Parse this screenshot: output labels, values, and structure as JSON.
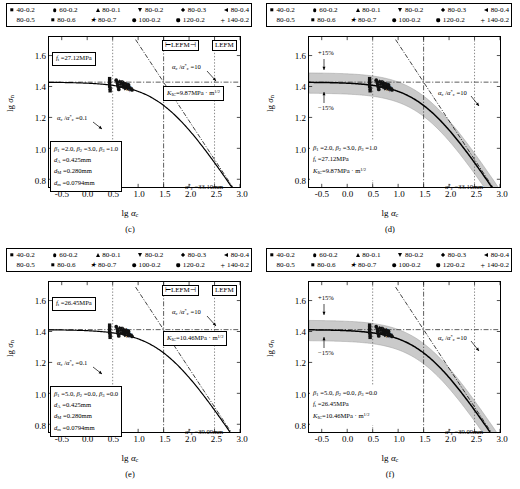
{
  "figure": {
    "panels": [
      "c",
      "d",
      "e",
      "f"
    ],
    "legend_entries": [
      {
        "label": "40-0.2",
        "marker": "square"
      },
      {
        "label": "60-0.2",
        "marker": "circle"
      },
      {
        "label": "80-0.1",
        "marker": "triangle-up"
      },
      {
        "label": "80-0.2",
        "marker": "triangle-down"
      },
      {
        "label": "80-0.3",
        "marker": "diamond"
      },
      {
        "label": "80-0.4",
        "marker": "triangle-left"
      },
      {
        "label": "80-0.5",
        "marker": "triangle-right"
      },
      {
        "label": "80-0.6",
        "marker": "square"
      },
      {
        "label": "80-0.7",
        "marker": "star"
      },
      {
        "label": "100-0.2",
        "marker": "circle"
      },
      {
        "label": "120-0.2",
        "marker": "hexagon"
      },
      {
        "label": "140-0.2",
        "marker": "plus"
      }
    ]
  },
  "chart_data": [
    {
      "id": "c",
      "type": "scatter",
      "panel_label": "(c)",
      "title": "",
      "xlabel": "lg αc",
      "ylabel": "lg σn",
      "xlim": [
        -0.75,
        3.0
      ],
      "ylim": [
        0.75,
        1.72
      ],
      "xticks": [
        "-0.5",
        "0.0",
        "0.5",
        "1.0",
        "1.5",
        "2.0",
        "2.5",
        "3.0"
      ],
      "xtick_values": [
        -0.5,
        0.0,
        0.5,
        1.0,
        1.5,
        2.0,
        2.5,
        3.0
      ],
      "yticks": [
        "0.8",
        "1.0",
        "1.2",
        "1.4",
        "1.6"
      ],
      "ytick_values": [
        0.8,
        1.0,
        1.2,
        1.4,
        1.6
      ],
      "grid": false,
      "band": false,
      "curve_plateau": 1.428,
      "annotations": {
        "ft": "ft =27.12MPa",
        "kic": "KIC=9.87MPa · m1/2",
        "ratio_low": "αc /α*c =0.1",
        "ratio_high": "αc /α*c =10",
        "alpha_star": "α*c =33.10mm",
        "lefm_left": "LEFM",
        "lefm_right": "LEFM",
        "params": [
          "β1 =2.0, β2 =3.0, β3 =1.0",
          "dA =0.425mm",
          "dM =0.280mm",
          "dm =0.0794mm"
        ]
      },
      "points": [
        {
          "x": 0.44,
          "y": 1.451,
          "m": "square"
        },
        {
          "x": 0.44,
          "y": 1.435,
          "m": "square"
        },
        {
          "x": 0.44,
          "y": 1.418,
          "m": "square"
        },
        {
          "x": 0.44,
          "y": 1.402,
          "m": "square"
        },
        {
          "x": 0.45,
          "y": 1.388,
          "m": "square"
        },
        {
          "x": 0.45,
          "y": 1.372,
          "m": "square"
        },
        {
          "x": 0.57,
          "y": 1.441,
          "m": "circle"
        },
        {
          "x": 0.59,
          "y": 1.426,
          "m": "circle"
        },
        {
          "x": 0.6,
          "y": 1.41,
          "m": "circle"
        },
        {
          "x": 0.61,
          "y": 1.396,
          "m": "circle"
        },
        {
          "x": 0.62,
          "y": 1.381,
          "m": "circle"
        },
        {
          "x": 0.63,
          "y": 1.433,
          "m": "triangle-up"
        },
        {
          "x": 0.65,
          "y": 1.418,
          "m": "triangle-up"
        },
        {
          "x": 0.66,
          "y": 1.4,
          "m": "triangle-up"
        },
        {
          "x": 0.67,
          "y": 1.43,
          "m": "triangle-down"
        },
        {
          "x": 0.69,
          "y": 1.412,
          "m": "triangle-down"
        },
        {
          "x": 0.7,
          "y": 1.396,
          "m": "triangle-down"
        },
        {
          "x": 0.71,
          "y": 1.424,
          "m": "diamond"
        },
        {
          "x": 0.72,
          "y": 1.408,
          "m": "diamond"
        },
        {
          "x": 0.73,
          "y": 1.392,
          "m": "diamond"
        },
        {
          "x": 0.74,
          "y": 1.42,
          "m": "triangle-left"
        },
        {
          "x": 0.75,
          "y": 1.402,
          "m": "triangle-left"
        },
        {
          "x": 0.76,
          "y": 1.386,
          "m": "triangle-right"
        },
        {
          "x": 0.77,
          "y": 1.404,
          "m": "triangle-right"
        },
        {
          "x": 0.78,
          "y": 1.418,
          "m": "star"
        },
        {
          "x": 0.79,
          "y": 1.398,
          "m": "star"
        },
        {
          "x": 0.8,
          "y": 1.382,
          "m": "star"
        },
        {
          "x": 0.81,
          "y": 1.41,
          "m": "hexagon"
        },
        {
          "x": 0.82,
          "y": 1.392,
          "m": "hexagon"
        },
        {
          "x": 0.83,
          "y": 1.376,
          "m": "plus"
        },
        {
          "x": 0.84,
          "y": 1.396,
          "m": "plus"
        },
        {
          "x": 0.86,
          "y": 1.385,
          "m": "square"
        },
        {
          "x": 0.88,
          "y": 1.378,
          "m": "circle"
        }
      ]
    },
    {
      "id": "d",
      "type": "scatter",
      "panel_label": "(d)",
      "title": "",
      "xlabel": "lg αc",
      "ylabel": "lg σn",
      "xlim": [
        -0.75,
        3.0
      ],
      "ylim": [
        0.75,
        1.72
      ],
      "xticks": [
        "-0.5",
        "0.0",
        "0.5",
        "1.0",
        "1.5",
        "2.0",
        "2.5",
        "3.0"
      ],
      "xtick_values": [
        -0.5,
        0.0,
        0.5,
        1.0,
        1.5,
        2.0,
        2.5,
        3.0
      ],
      "yticks": [
        "0.8",
        "1.0",
        "1.2",
        "1.4",
        "1.6"
      ],
      "ytick_values": [
        0.8,
        1.0,
        1.2,
        1.4,
        1.6
      ],
      "grid": false,
      "band": true,
      "band_label_upper": "+15%",
      "band_label_lower": "−15%",
      "curve_plateau": 1.428,
      "annotations": {
        "ratio_high": "αc /α*c =10",
        "alpha_star": "α*c =33.10mm",
        "params": [
          "β1 =2.0, β2 =3.0, β3 =1.0",
          "ft =27.12MPa",
          "KIC=9.87MPa · m1/2"
        ]
      },
      "points": [
        {
          "x": 0.44,
          "y": 1.451,
          "m": "square"
        },
        {
          "x": 0.44,
          "y": 1.435,
          "m": "square"
        },
        {
          "x": 0.44,
          "y": 1.418,
          "m": "square"
        },
        {
          "x": 0.44,
          "y": 1.402,
          "m": "square"
        },
        {
          "x": 0.45,
          "y": 1.388,
          "m": "square"
        },
        {
          "x": 0.45,
          "y": 1.372,
          "m": "square"
        },
        {
          "x": 0.57,
          "y": 1.441,
          "m": "circle"
        },
        {
          "x": 0.59,
          "y": 1.426,
          "m": "circle"
        },
        {
          "x": 0.6,
          "y": 1.41,
          "m": "circle"
        },
        {
          "x": 0.61,
          "y": 1.396,
          "m": "circle"
        },
        {
          "x": 0.62,
          "y": 1.381,
          "m": "circle"
        },
        {
          "x": 0.63,
          "y": 1.433,
          "m": "triangle-up"
        },
        {
          "x": 0.65,
          "y": 1.418,
          "m": "triangle-up"
        },
        {
          "x": 0.66,
          "y": 1.4,
          "m": "triangle-up"
        },
        {
          "x": 0.67,
          "y": 1.43,
          "m": "triangle-down"
        },
        {
          "x": 0.69,
          "y": 1.412,
          "m": "triangle-down"
        },
        {
          "x": 0.7,
          "y": 1.396,
          "m": "triangle-down"
        },
        {
          "x": 0.71,
          "y": 1.424,
          "m": "diamond"
        },
        {
          "x": 0.72,
          "y": 1.408,
          "m": "diamond"
        },
        {
          "x": 0.73,
          "y": 1.392,
          "m": "diamond"
        },
        {
          "x": 0.74,
          "y": 1.42,
          "m": "triangle-left"
        },
        {
          "x": 0.75,
          "y": 1.402,
          "m": "triangle-left"
        },
        {
          "x": 0.76,
          "y": 1.386,
          "m": "triangle-right"
        },
        {
          "x": 0.77,
          "y": 1.404,
          "m": "triangle-right"
        },
        {
          "x": 0.78,
          "y": 1.418,
          "m": "star"
        },
        {
          "x": 0.79,
          "y": 1.398,
          "m": "star"
        },
        {
          "x": 0.8,
          "y": 1.382,
          "m": "star"
        },
        {
          "x": 0.81,
          "y": 1.41,
          "m": "hexagon"
        },
        {
          "x": 0.82,
          "y": 1.392,
          "m": "hexagon"
        },
        {
          "x": 0.83,
          "y": 1.376,
          "m": "plus"
        },
        {
          "x": 0.84,
          "y": 1.396,
          "m": "plus"
        },
        {
          "x": 0.86,
          "y": 1.385,
          "m": "square"
        },
        {
          "x": 0.88,
          "y": 1.378,
          "m": "circle"
        }
      ]
    },
    {
      "id": "e",
      "type": "scatter",
      "panel_label": "(e)",
      "title": "",
      "xlabel": "lg αc",
      "ylabel": "lg σn",
      "xlim": [
        -0.75,
        3.0
      ],
      "ylim": [
        0.75,
        1.72
      ],
      "xticks": [
        "-0.5",
        "0.0",
        "0.5",
        "1.0",
        "1.5",
        "2.0",
        "2.5",
        "3.0"
      ],
      "xtick_values": [
        -0.5,
        0.0,
        0.5,
        1.0,
        1.5,
        2.0,
        2.5,
        3.0
      ],
      "yticks": [
        "0.8",
        "1.0",
        "1.2",
        "1.4",
        "1.6"
      ],
      "ytick_values": [
        0.8,
        1.0,
        1.2,
        1.4,
        1.6
      ],
      "grid": false,
      "band": false,
      "curve_plateau": 1.412,
      "annotations": {
        "ft": "ft =26.45MPa",
        "kic": "KIC=10.46MPa · m1/2",
        "ratio_low": "αc /α*c =0.1",
        "ratio_high": "αc /α*c =10",
        "alpha_star": "α*c =39.09mm",
        "lefm_left": "LEFM",
        "lefm_right": "LEFM",
        "params": [
          "β1 =5.0, β2 =0.0, β3 =0.0",
          "dA =0.425mm",
          "dM =0.280mm",
          "dm =0.0794mm"
        ]
      },
      "points": [
        {
          "x": 0.44,
          "y": 1.441,
          "m": "square"
        },
        {
          "x": 0.44,
          "y": 1.425,
          "m": "square"
        },
        {
          "x": 0.44,
          "y": 1.408,
          "m": "square"
        },
        {
          "x": 0.44,
          "y": 1.392,
          "m": "square"
        },
        {
          "x": 0.45,
          "y": 1.378,
          "m": "square"
        },
        {
          "x": 0.45,
          "y": 1.362,
          "m": "square"
        },
        {
          "x": 0.57,
          "y": 1.431,
          "m": "circle"
        },
        {
          "x": 0.59,
          "y": 1.416,
          "m": "circle"
        },
        {
          "x": 0.6,
          "y": 1.4,
          "m": "circle"
        },
        {
          "x": 0.61,
          "y": 1.386,
          "m": "circle"
        },
        {
          "x": 0.62,
          "y": 1.371,
          "m": "circle"
        },
        {
          "x": 0.63,
          "y": 1.423,
          "m": "triangle-up"
        },
        {
          "x": 0.65,
          "y": 1.408,
          "m": "triangle-up"
        },
        {
          "x": 0.66,
          "y": 1.39,
          "m": "triangle-up"
        },
        {
          "x": 0.67,
          "y": 1.42,
          "m": "triangle-down"
        },
        {
          "x": 0.69,
          "y": 1.402,
          "m": "triangle-down"
        },
        {
          "x": 0.7,
          "y": 1.386,
          "m": "triangle-down"
        },
        {
          "x": 0.71,
          "y": 1.414,
          "m": "diamond"
        },
        {
          "x": 0.72,
          "y": 1.398,
          "m": "diamond"
        },
        {
          "x": 0.73,
          "y": 1.382,
          "m": "diamond"
        },
        {
          "x": 0.74,
          "y": 1.41,
          "m": "triangle-left"
        },
        {
          "x": 0.75,
          "y": 1.392,
          "m": "triangle-left"
        },
        {
          "x": 0.76,
          "y": 1.376,
          "m": "triangle-right"
        },
        {
          "x": 0.77,
          "y": 1.394,
          "m": "triangle-right"
        },
        {
          "x": 0.78,
          "y": 1.408,
          "m": "star"
        },
        {
          "x": 0.79,
          "y": 1.388,
          "m": "star"
        },
        {
          "x": 0.8,
          "y": 1.372,
          "m": "star"
        },
        {
          "x": 0.81,
          "y": 1.4,
          "m": "hexagon"
        },
        {
          "x": 0.82,
          "y": 1.382,
          "m": "hexagon"
        },
        {
          "x": 0.83,
          "y": 1.366,
          "m": "plus"
        },
        {
          "x": 0.84,
          "y": 1.386,
          "m": "plus"
        },
        {
          "x": 0.86,
          "y": 1.375,
          "m": "square"
        },
        {
          "x": 0.88,
          "y": 1.368,
          "m": "circle"
        }
      ]
    },
    {
      "id": "f",
      "type": "scatter",
      "panel_label": "(f)",
      "title": "",
      "xlabel": "lg αc",
      "ylabel": "lg σn",
      "xlim": [
        -0.75,
        3.0
      ],
      "ylim": [
        0.75,
        1.72
      ],
      "xticks": [
        "-0.5",
        "0.0",
        "0.5",
        "1.0",
        "1.5",
        "2.0",
        "2.5",
        "3.0"
      ],
      "xtick_values": [
        -0.5,
        0.0,
        0.5,
        1.0,
        1.5,
        2.0,
        2.5,
        3.0
      ],
      "yticks": [
        "0.8",
        "1.0",
        "1.2",
        "1.4",
        "1.6"
      ],
      "ytick_values": [
        0.8,
        1.0,
        1.2,
        1.4,
        1.6
      ],
      "grid": false,
      "band": true,
      "band_label_upper": "+15%",
      "band_label_lower": "−15%",
      "curve_plateau": 1.412,
      "annotations": {
        "ratio_high": "αc /α*c =10",
        "alpha_star": "α*c =39.09mm",
        "params": [
          "β1 =5.0, β2 =0.0, β3 =0.0",
          "ft =26.45MPa",
          "KIC=10.46MPa · m1/2"
        ]
      },
      "points": [
        {
          "x": 0.44,
          "y": 1.441,
          "m": "square"
        },
        {
          "x": 0.44,
          "y": 1.425,
          "m": "square"
        },
        {
          "x": 0.44,
          "y": 1.408,
          "m": "square"
        },
        {
          "x": 0.44,
          "y": 1.392,
          "m": "square"
        },
        {
          "x": 0.45,
          "y": 1.378,
          "m": "square"
        },
        {
          "x": 0.45,
          "y": 1.362,
          "m": "square"
        },
        {
          "x": 0.57,
          "y": 1.431,
          "m": "circle"
        },
        {
          "x": 0.59,
          "y": 1.416,
          "m": "circle"
        },
        {
          "x": 0.6,
          "y": 1.4,
          "m": "circle"
        },
        {
          "x": 0.61,
          "y": 1.386,
          "m": "circle"
        },
        {
          "x": 0.62,
          "y": 1.371,
          "m": "circle"
        },
        {
          "x": 0.63,
          "y": 1.423,
          "m": "triangle-up"
        },
        {
          "x": 0.65,
          "y": 1.408,
          "m": "triangle-up"
        },
        {
          "x": 0.66,
          "y": 1.39,
          "m": "triangle-up"
        },
        {
          "x": 0.67,
          "y": 1.42,
          "m": "triangle-down"
        },
        {
          "x": 0.69,
          "y": 1.402,
          "m": "triangle-down"
        },
        {
          "x": 0.7,
          "y": 1.386,
          "m": "triangle-down"
        },
        {
          "x": 0.71,
          "y": 1.414,
          "m": "diamond"
        },
        {
          "x": 0.72,
          "y": 1.398,
          "m": "diamond"
        },
        {
          "x": 0.73,
          "y": 1.382,
          "m": "diamond"
        },
        {
          "x": 0.74,
          "y": 1.41,
          "m": "triangle-left"
        },
        {
          "x": 0.75,
          "y": 1.392,
          "m": "triangle-left"
        },
        {
          "x": 0.76,
          "y": 1.376,
          "m": "triangle-right"
        },
        {
          "x": 0.77,
          "y": 1.394,
          "m": "triangle-right"
        },
        {
          "x": 0.78,
          "y": 1.408,
          "m": "star"
        },
        {
          "x": 0.79,
          "y": 1.388,
          "m": "star"
        },
        {
          "x": 0.8,
          "y": 1.372,
          "m": "star"
        },
        {
          "x": 0.81,
          "y": 1.4,
          "m": "hexagon"
        },
        {
          "x": 0.82,
          "y": 1.382,
          "m": "hexagon"
        },
        {
          "x": 0.83,
          "y": 1.366,
          "m": "plus"
        },
        {
          "x": 0.84,
          "y": 1.386,
          "m": "plus"
        },
        {
          "x": 0.86,
          "y": 1.375,
          "m": "square"
        },
        {
          "x": 0.88,
          "y": 1.368,
          "m": "circle"
        }
      ]
    }
  ]
}
